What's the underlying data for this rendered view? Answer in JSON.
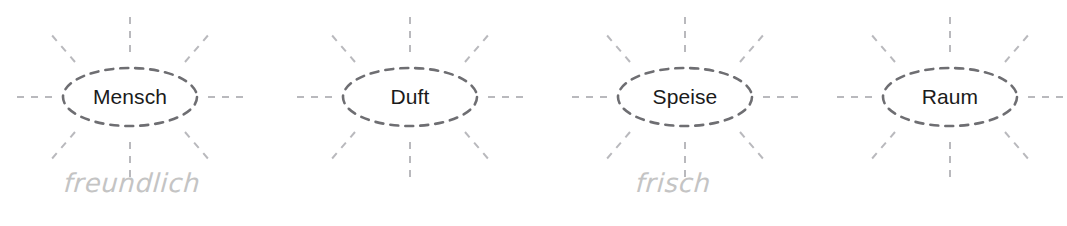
{
  "diagram": {
    "background_color": "#ffffff",
    "node_text_color": "#1b1b1b",
    "node_border_color": "#6e6e72",
    "ray_color": "#b9b9bd",
    "hand_label_color": "#c4c4c4",
    "ray_count": 8,
    "clusters": [
      {
        "id": "cluster-mensch",
        "label": "Mensch",
        "hand_label": "freundlich",
        "center_x": 130,
        "hand_label_x": 64
      },
      {
        "id": "cluster-duft",
        "label": "Duft",
        "hand_label": "",
        "center_x": 410,
        "hand_label_x": 0
      },
      {
        "id": "cluster-speise",
        "label": "Speise",
        "hand_label": "frisch",
        "center_x": 685,
        "hand_label_x": 636
      },
      {
        "id": "cluster-raum",
        "label": "Raum",
        "hand_label": "",
        "center_x": 950,
        "hand_label_x": 0
      }
    ]
  }
}
